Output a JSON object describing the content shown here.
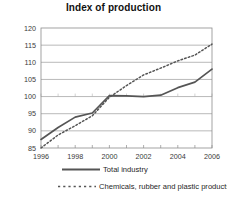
{
  "chart_data": {
    "type": "line",
    "title": "Index of production",
    "xlabel": "",
    "ylabel": "",
    "xlim": [
      1996,
      2006
    ],
    "ylim": [
      85,
      120
    ],
    "grid": true,
    "grid_axis": "y",
    "legend_position": "bottom",
    "x_ticks": [
      1996,
      1998,
      2000,
      2002,
      2004,
      2006
    ],
    "x_minor_ticks": [
      1997,
      1999,
      2001,
      2003,
      2005
    ],
    "y_ticks": [
      85,
      90,
      95,
      100,
      105,
      110,
      115,
      120
    ],
    "x": [
      1996,
      1997,
      1998,
      1999,
      2000,
      2001,
      2002,
      2003,
      2004,
      2005,
      2006
    ],
    "series": [
      {
        "name": "Total industry",
        "style": "solid",
        "color": "#555555",
        "values": [
          87.5,
          91.0,
          94.0,
          95.2,
          100.3,
          100.2,
          100.0,
          100.4,
          102.6,
          104.2,
          108.0
        ]
      },
      {
        "name": "Chemicals, rubber and plastic products",
        "style": "dashed",
        "color": "#555555",
        "values": [
          84.6,
          88.8,
          91.5,
          94.4,
          99.8,
          103.2,
          106.3,
          108.3,
          110.4,
          112.1,
          115.3
        ]
      }
    ]
  },
  "legend": {
    "items": [
      {
        "label": "Total industry",
        "style": "solid"
      },
      {
        "label": "Chemicals, rubber and plastic products",
        "style": "dashed"
      }
    ]
  }
}
